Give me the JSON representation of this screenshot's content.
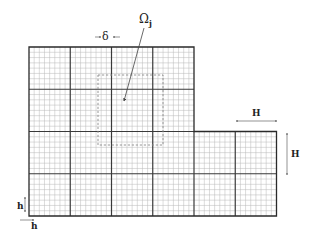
{
  "diagram": {
    "colors": {
      "background": "#ffffff",
      "major_lines": "#3a3a3a",
      "fine_lines": "#b8b8b8",
      "dashed_subdomain": "#8a8a8a",
      "labels": "#222222"
    },
    "grid": {
      "origin": [
        29,
        47
      ],
      "block_width": 41.25,
      "block_height": 42.25,
      "fine_cells_per_block": 8,
      "top_region": {
        "cols": 4,
        "rows": 2
      },
      "bottom_region": {
        "cols": 6,
        "rows": 2
      }
    },
    "labels": {
      "subdomain": "Ω",
      "subdomain_sub": "j",
      "overlap": "δ",
      "coarse_h_top": "H",
      "coarse_h_right": "H",
      "fine_h_left": "h",
      "fine_h_bottom": "h"
    },
    "overlap_region": {
      "x": 98,
      "y": 75,
      "width": 65,
      "height": 70
    },
    "pointer": {
      "from": [
        144,
        27
      ],
      "to": [
        124,
        102
      ]
    }
  }
}
